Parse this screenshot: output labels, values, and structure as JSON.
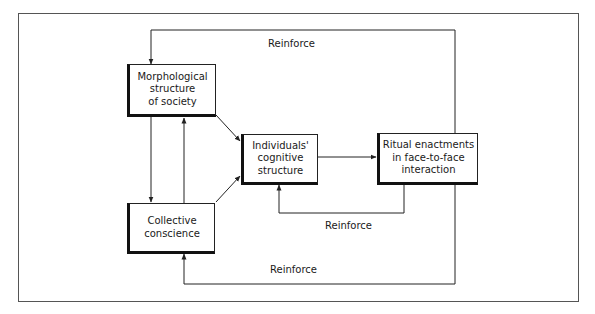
{
  "diagram": {
    "type": "flow",
    "nodes": [
      {
        "id": "morph",
        "label": "Morphological\nstructure\nof society"
      },
      {
        "id": "collective",
        "label": "Collective\nconscience"
      },
      {
        "id": "individuals",
        "label": "Individuals'\ncognitive\nstructure"
      },
      {
        "id": "ritual",
        "label": "Ritual enactments\nin face-to-face\ninteraction"
      }
    ],
    "edges": [
      {
        "from": "morph",
        "to": "collective",
        "label": ""
      },
      {
        "from": "collective",
        "to": "morph",
        "label": ""
      },
      {
        "from": "morph",
        "to": "individuals",
        "label": ""
      },
      {
        "from": "collective",
        "to": "individuals",
        "label": ""
      },
      {
        "from": "individuals",
        "to": "ritual",
        "label": ""
      },
      {
        "from": "ritual",
        "to": "individuals",
        "label": "Reinforce"
      },
      {
        "from": "ritual",
        "to": "morph",
        "label": "Reinforce"
      },
      {
        "from": "ritual",
        "to": "collective",
        "label": "Reinforce"
      }
    ],
    "labels": {
      "top_reinforce": "Reinforce",
      "middle_reinforce": "Reinforce",
      "bottom_reinforce": "Reinforce"
    },
    "colors": {
      "line": "#222222",
      "frame": "#555555",
      "background": "#ffffff"
    }
  }
}
